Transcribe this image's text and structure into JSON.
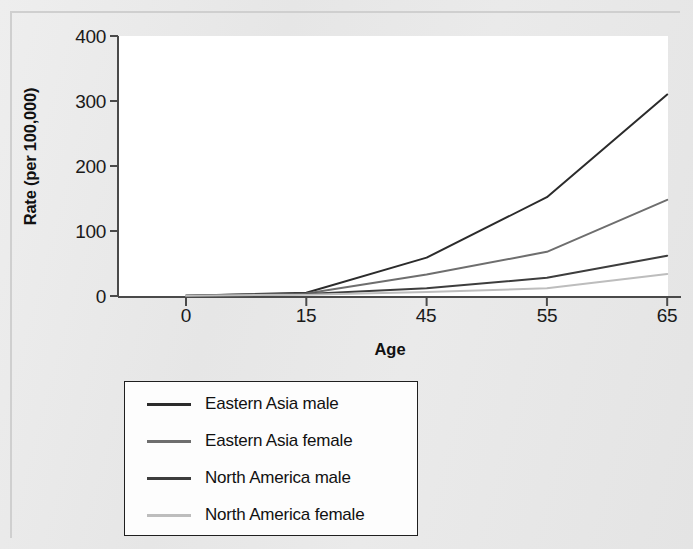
{
  "chart_data": {
    "type": "line",
    "title": "",
    "xlabel": "Age",
    "ylabel": "Rate (per 100,000)",
    "categories": [
      "0",
      "15",
      "45",
      "55",
      "65"
    ],
    "x_tick_labels": [
      "0",
      "15",
      "45",
      "55",
      "65"
    ],
    "y_tick_labels": [
      "0",
      "100",
      "200",
      "300",
      "400"
    ],
    "y_ticks": [
      0,
      100,
      200,
      300,
      400
    ],
    "ylim": [
      0,
      400
    ],
    "grid": false,
    "legend_position": "below-plot",
    "series": [
      {
        "name": "Eastern Asia male",
        "color": "#2b2b2b",
        "values": [
          0.5,
          5,
          59,
          152,
          310
        ]
      },
      {
        "name": "Eastern Asia female",
        "color": "#6e6e6e",
        "values": [
          0.5,
          4,
          33,
          68,
          148
        ]
      },
      {
        "name": "North America male",
        "color": "#3d3d3d",
        "values": [
          0.5,
          3,
          12,
          28,
          62
        ]
      },
      {
        "name": "North America female",
        "color": "#bdbdbd",
        "values": [
          0.5,
          2,
          6,
          12,
          34
        ]
      }
    ]
  },
  "colors": {
    "page_background": "#e8e8e8",
    "plot_background": "#ffffff",
    "axis": "#4a4a4a",
    "text": "#111111",
    "legend_border": "#1f1f1f"
  }
}
